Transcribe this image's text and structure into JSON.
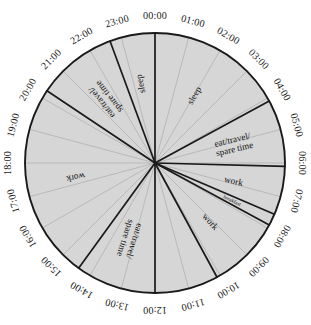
{
  "chart_data": {
    "type": "pie",
    "title": "",
    "subtitle": "",
    "xlabel": "",
    "ylabel": "",
    "legend_position": "none",
    "grid": true,
    "total_hours": 24,
    "hours_per_revolution": 24,
    "start_angle_hour": 0,
    "direction": "clockwise",
    "tick_labels": [
      "00:00",
      "01:00",
      "02:00",
      "03:00",
      "04:00",
      "05:00",
      "06:00",
      "07:00",
      "08:00",
      "09:00",
      "10:00",
      "11:00",
      "12:00",
      "13:00",
      "14:00",
      "15:00",
      "16:00",
      "17:00",
      "18:00",
      "19:00",
      "20:00",
      "21:00",
      "22:00",
      "23:00"
    ],
    "categories": [
      "sleep",
      "eat/travel/ spare time",
      "work",
      "breakfast",
      "work",
      "eat/travel/ spare time",
      "work",
      "eat/travel/ spare time",
      "sleep"
    ],
    "values": [
      4.1,
      2.0,
      1.45,
      0.35,
      2.2,
      2.4,
      5.85,
      2.4,
      3.25
    ],
    "segments": [
      {
        "label": "sleep",
        "start_hour": 0.0,
        "end_hour": 4.1,
        "hours": 4.1,
        "color": "#d6d6d6"
      },
      {
        "label": "eat/travel/ spare time",
        "start_hour": 4.1,
        "end_hour": 6.1,
        "hours": 2.0,
        "color": "#d6d6d6"
      },
      {
        "label": "work",
        "start_hour": 6.1,
        "end_hour": 7.55,
        "hours": 1.45,
        "color": "#d6d6d6"
      },
      {
        "label": "breakfast",
        "start_hour": 7.55,
        "end_hour": 7.9,
        "hours": 0.35,
        "color": "#d6d6d6"
      },
      {
        "label": "work",
        "start_hour": 7.9,
        "end_hour": 10.1,
        "hours": 2.2,
        "color": "#d6d6d6"
      },
      {
        "label": "eat/travel/ spare time",
        "start_hour": 12.0,
        "end_hour": 14.4,
        "hours": 2.4,
        "color": "#d6d6d6"
      },
      {
        "label": "work",
        "start_hour": 14.4,
        "end_hour": 20.25,
        "hours": 5.85,
        "color": "#d6d6d6"
      },
      {
        "label": "eat/travel/ spare time",
        "start_hour": 20.25,
        "end_hour": 22.65,
        "hours": 2.4,
        "color": "#d6d6d6"
      },
      {
        "label": "sleep",
        "start_hour": 22.65,
        "end_hour": 24.0,
        "hours": 1.35,
        "color": "#d6d6d6"
      }
    ],
    "divider_hours": [
      0.0,
      4.1,
      6.1,
      7.55,
      7.9,
      10.1,
      12.0,
      14.4,
      20.25,
      22.65
    ],
    "segment_labels": [
      {
        "text_line1": "sleep",
        "text_line2": "",
        "hour": 2.0,
        "radius_frac": 0.6,
        "size": "normal"
      },
      {
        "text_line1": "eat/travel/",
        "text_line2": "spare time",
        "hour": 5.1,
        "radius_frac": 0.62,
        "size": "normal"
      },
      {
        "text_line1": "work",
        "text_line2": "",
        "hour": 6.85,
        "radius_frac": 0.62,
        "size": "normal"
      },
      {
        "text_line1": "breakfast",
        "text_line2": "",
        "hour": 7.72,
        "radius_frac": 0.66,
        "size": "small"
      },
      {
        "text_line1": "work",
        "text_line2": "",
        "hour": 9.1,
        "radius_frac": 0.62,
        "size": "normal"
      },
      {
        "text_line1": "eat/travel/",
        "text_line2": "spare time",
        "hour": 13.2,
        "radius_frac": 0.62,
        "size": "normal"
      },
      {
        "text_line1": "work",
        "text_line2": "",
        "hour": 17.3,
        "radius_frac": 0.62,
        "size": "normal"
      },
      {
        "text_line1": "eat/travel/",
        "text_line2": "spare time",
        "hour": 21.45,
        "radius_frac": 0.62,
        "size": "normal"
      },
      {
        "text_line1": "sleep",
        "text_line2": "",
        "hour": 23.3,
        "radius_frac": 0.62,
        "size": "normal"
      }
    ],
    "geometry": {
      "center_x": 155,
      "center_y": 163,
      "radius": 130,
      "label_radius": 147
    },
    "colors": {
      "wedge_fill": "#d6d6d6",
      "outline": "#1a1a1a",
      "gridline": "#9a9a9a",
      "text": "#111111",
      "background": "#ffffff"
    }
  }
}
